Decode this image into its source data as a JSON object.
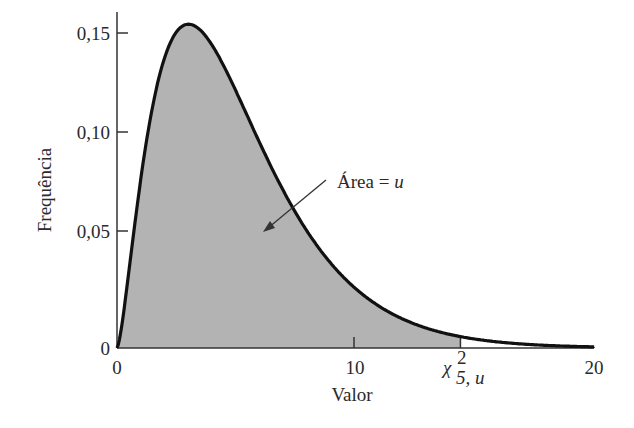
{
  "chart_data": {
    "type": "area",
    "title": "",
    "xlabel": "Valor",
    "ylabel": "Frequência",
    "xlim": [
      0,
      20
    ],
    "ylim": [
      0,
      0.16
    ],
    "x_ticks": [
      0,
      10,
      20
    ],
    "x_tick_labels": [
      "0",
      "10",
      "20"
    ],
    "y_ticks": [
      0,
      0.05,
      0.1,
      0.15
    ],
    "y_tick_labels": [
      "0",
      "0,05",
      "0,10",
      "0,15"
    ],
    "grid": false,
    "legend": null,
    "distribution": "chi-square",
    "degrees_of_freedom": 5,
    "critical_value_label": "χ²₅,ᵤ",
    "critical_value_approx": 14.4,
    "shaded_region": {
      "from": 0,
      "to": 14.4,
      "color": "#b3b3b3"
    },
    "annotations": [
      {
        "text": "Área = u",
        "x": 10.3,
        "y": 0.077,
        "arrow_to": {
          "x": 6.3,
          "y": 0.054
        }
      }
    ],
    "series": [
      {
        "name": "chi-square pdf (df=5)",
        "x": [
          0,
          0.5,
          1,
          1.5,
          2,
          2.5,
          3,
          3.5,
          4,
          4.5,
          5,
          6,
          7,
          8,
          9,
          10,
          11,
          12,
          13,
          14,
          15,
          16,
          17,
          18,
          19,
          20
        ],
        "values": [
          0,
          0.0366,
          0.0807,
          0.1151,
          0.1384,
          0.1505,
          0.1542,
          0.1518,
          0.1465,
          0.1379,
          0.1293,
          0.1075,
          0.0862,
          0.0675,
          0.0516,
          0.0389,
          0.0287,
          0.021,
          0.0152,
          0.0109,
          0.0077,
          0.0055,
          0.0038,
          0.0027,
          0.0018,
          0.0013
        ]
      }
    ]
  },
  "labels": {
    "y_axis_title": "Frequência",
    "x_axis_title": "Valor",
    "y_tick_0": "0",
    "y_tick_005": "0,05",
    "y_tick_010": "0,10",
    "y_tick_015": "0,15",
    "x_tick_0": "0",
    "x_tick_10": "10",
    "x_tick_20": "20",
    "area_label_prefix": "Área = ",
    "area_label_var": "u",
    "chi_symbol": "χ",
    "chi_sup": "2",
    "chi_sub": "5, u"
  },
  "colors": {
    "shade": "#b3b3b3",
    "curve": "#111111",
    "axis": "#333333",
    "background": "#ffffff"
  }
}
